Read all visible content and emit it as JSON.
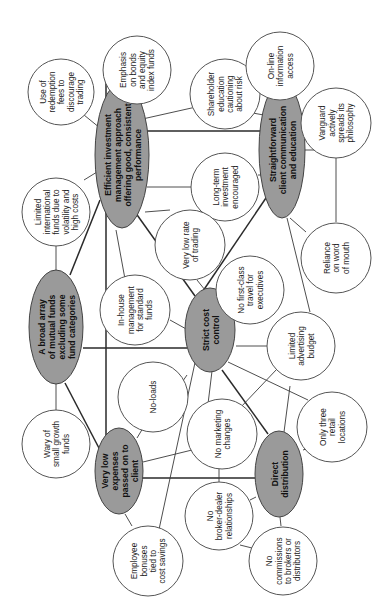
{
  "diagram": {
    "colors": {
      "hub_fill": "#9a9a9a",
      "leaf_fill": "#ffffff",
      "line": "#3a3a3a"
    },
    "hubs": [
      {
        "id": "efficient",
        "lines": [
          "Efficient investment",
          "management approach",
          "offering good, consistent",
          "performance"
        ]
      },
      {
        "id": "straightforward",
        "lines": [
          "Straightforward",
          "client communication",
          "and education"
        ]
      },
      {
        "id": "broad",
        "lines": [
          "A broad array",
          "of mutual funds",
          "excluding some",
          "fund categories"
        ]
      },
      {
        "id": "strict",
        "lines": [
          "Strict cost",
          "control"
        ]
      },
      {
        "id": "lowexp",
        "lines": [
          "Very low",
          "expenses",
          "passed on to",
          "client"
        ]
      },
      {
        "id": "direct",
        "lines": [
          "Direct",
          "distribution"
        ]
      }
    ],
    "leaves": [
      {
        "id": "redemption",
        "lines": [
          "Use of",
          "redemption",
          "fees to",
          "discourage",
          "trading"
        ]
      },
      {
        "id": "bonds",
        "lines": [
          "Emphasis",
          "on bonds",
          "and equity",
          "index funds"
        ]
      },
      {
        "id": "shareholder",
        "lines": [
          "Shareholder",
          "education",
          "cautioning",
          "about risk"
        ]
      },
      {
        "id": "online",
        "lines": [
          "On-line",
          "information",
          "access"
        ]
      },
      {
        "id": "vanguard",
        "lines": [
          "Vanguard",
          "actively",
          "spreads its",
          "philosophy"
        ]
      },
      {
        "id": "longterm",
        "lines": [
          "Long-term",
          "investment",
          "encouraged"
        ]
      },
      {
        "id": "international",
        "lines": [
          "Limited",
          "international",
          "funds due to",
          "volatility and",
          "high costs"
        ]
      },
      {
        "id": "lowrate",
        "lines": [
          "Very low rate",
          "of trading"
        ]
      },
      {
        "id": "inhouse",
        "lines": [
          "In-house",
          "management",
          "for standard",
          "funds"
        ]
      },
      {
        "id": "firstclass",
        "lines": [
          "No first-class",
          "travel for",
          "executives"
        ]
      },
      {
        "id": "reliance",
        "lines": [
          "Reliance",
          "on word",
          "of mouth"
        ]
      },
      {
        "id": "advertising",
        "lines": [
          "Limited",
          "advertising",
          "budget"
        ]
      },
      {
        "id": "noloads",
        "lines": [
          "No-loads"
        ]
      },
      {
        "id": "marketing",
        "lines": [
          "No marketing",
          "changes"
        ]
      },
      {
        "id": "retail",
        "lines": [
          "Only three",
          "retail",
          "locations"
        ]
      },
      {
        "id": "wary",
        "lines": [
          "Wary of",
          "small growth",
          "funds"
        ]
      },
      {
        "id": "broker",
        "lines": [
          "No",
          "broker-dealer",
          "relationships"
        ]
      },
      {
        "id": "bonuses",
        "lines": [
          "Employee",
          "bonuses",
          "tied to",
          "cost savings"
        ]
      },
      {
        "id": "commissions",
        "lines": [
          "No",
          "commissions",
          "to brokers or",
          "distributors"
        ]
      }
    ]
  }
}
